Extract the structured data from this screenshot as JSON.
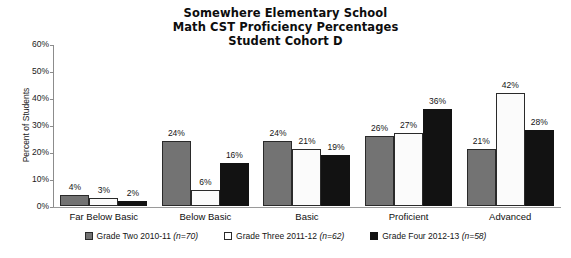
{
  "chart_data": {
    "type": "bar",
    "title": "Somewhere Elementary School\nMath CST Proficiency Percentages\nStudent Cohort D",
    "title_lines": [
      "Somewhere Elementary School",
      "Math CST Proficiency Percentages",
      "Student Cohort D"
    ],
    "xlabel": "",
    "ylabel": "Percent of Students",
    "ylim": [
      0,
      60
    ],
    "ytick_labels": [
      "60%",
      "50%",
      "40%",
      "30%",
      "20%",
      "10%",
      "0%"
    ],
    "ytick_values": [
      60,
      50,
      40,
      30,
      20,
      10,
      0
    ],
    "grid": false,
    "legend_position": "bottom",
    "categories": [
      "Far Below Basic",
      "Below Basic",
      "Basic",
      "Proficient",
      "Advanced"
    ],
    "series": [
      {
        "name": "Grade Two 2010-11 (n=70)",
        "legend_text": "Grade Two 2010-11",
        "legend_n": "(n=70)",
        "color": "#737373",
        "values": [
          4,
          24,
          24,
          26,
          21
        ],
        "value_labels": [
          "4%",
          "24%",
          "24%",
          "26%",
          "21%"
        ]
      },
      {
        "name": "Grade Three 2011-12 (n=62)",
        "legend_text": "Grade Three 2011-12",
        "legend_n": "(n=62)",
        "color": "#ffffff",
        "values": [
          3,
          6,
          21,
          27,
          42
        ],
        "value_labels": [
          "3%",
          "6%",
          "21%",
          "27%",
          "42%"
        ]
      },
      {
        "name": "Grade Four 2012-13 (n=58)",
        "legend_text": "Grade Four 2012-13",
        "legend_n": "(n=58)",
        "color": "#121212",
        "values": [
          2,
          16,
          19,
          36,
          28
        ],
        "value_labels": [
          "2%",
          "16%",
          "19%",
          "36%",
          "28%"
        ]
      }
    ]
  }
}
